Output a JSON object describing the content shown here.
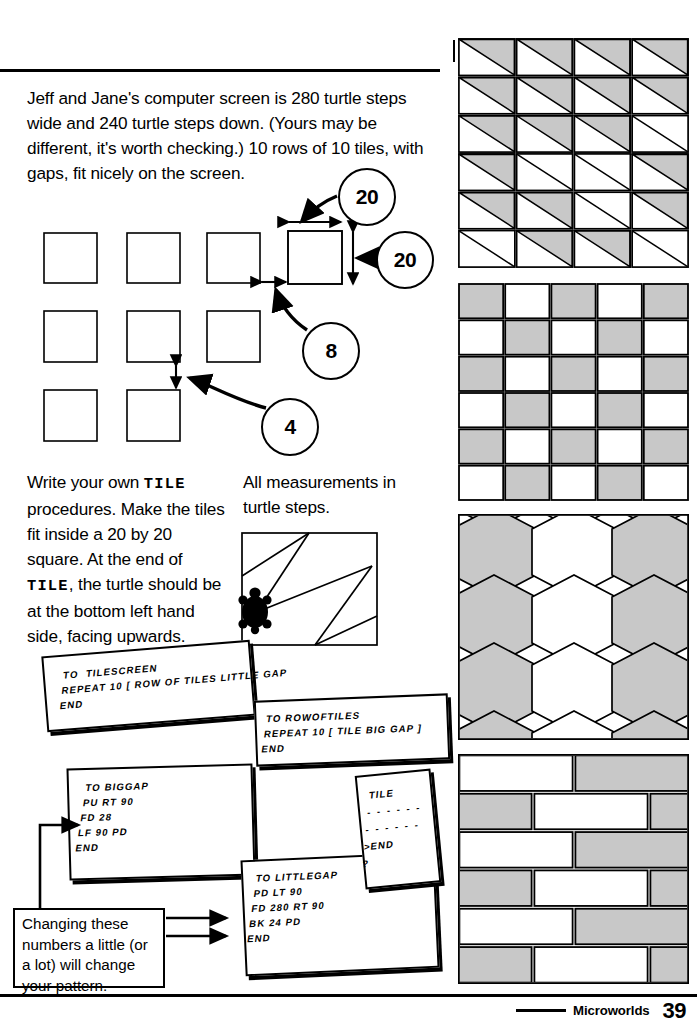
{
  "page": {
    "footer_label": "Microworlds",
    "page_number": "39",
    "ink_color": "#000000",
    "fill_gray": "#c8c8c8",
    "background": "#ffffff"
  },
  "intro": {
    "text": "Jeff and Jane's computer screen is 280 turtle steps wide and 240 turtle steps down. (Yours may be different, it's worth checking.) 10 rows of 10 tiles, with gaps, fit nicely on the screen."
  },
  "diagram": {
    "callouts": [
      {
        "id": "tile-width",
        "value": "20",
        "meaning": "tile width in turtle steps"
      },
      {
        "id": "tile-height",
        "value": "20",
        "meaning": "tile height in turtle steps"
      },
      {
        "id": "big-gap",
        "value": "8",
        "meaning": "horizontal gap between tiles"
      },
      {
        "id": "little-gap",
        "value": "4",
        "meaning": "vertical gap between rows"
      }
    ],
    "tile_rows": 3,
    "tile_cols": 3
  },
  "instructions": {
    "line1_a": "Write your own ",
    "tile_word_1": "TILE",
    "line1_b": " procedures. Make the tiles fit inside a 20 by 20 square. At the end of ",
    "tile_word_2": "TILE",
    "line1_c": ", the turtle should be at the bottom left hand side, facing upwards."
  },
  "measure_note": {
    "text": "All measurements in turtle steps."
  },
  "example_tile": {
    "caption": "example tile with turtle at bottom left",
    "turtle_icon": "turtle-icon"
  },
  "cards": [
    {
      "id": "tilescreen",
      "lines": [
        "TO  TILESCREEN",
        "REPEAT 10 [ ROW OF TILES LITTLE GAP",
        "END"
      ]
    },
    {
      "id": "rowoftiles",
      "lines": [
        "TO ROWOFTILES",
        "REPEAT 10 [ TILE BIG GAP ]",
        "END"
      ]
    },
    {
      "id": "biggap",
      "lines": [
        "TO BIGGAP",
        "PU RT 90",
        "FD 28",
        "LF 90 PD",
        "END"
      ]
    },
    {
      "id": "littlegap",
      "lines": [
        "TO LITTLEGAP",
        "PD LT 90",
        "FD 280 RT 90",
        "BK 24 PD",
        "END"
      ]
    },
    {
      "id": "tile",
      "lines": [
        "TILE",
        "- - - - - -",
        "- - - - - -",
        ">END",
        "?"
      ]
    }
  ],
  "caption": {
    "text": "Changing these numbers a little (or a lot) will change your pattern."
  },
  "patterns": [
    {
      "id": "triangles",
      "name": "triangle-tiling-pattern",
      "cols": 4,
      "rows": 6,
      "description": "Each square tile split by a diagonal; upper-left triangle shaded grey on most tiles."
    },
    {
      "id": "checkerboard",
      "name": "checkerboard-tiling-pattern",
      "cols": 5,
      "rows": 6,
      "description": "Alternating grey and white squares."
    },
    {
      "id": "hexagons",
      "name": "hexagon-tiling-pattern",
      "cols": 3,
      "rows": 4,
      "description": "Honeycomb of hexagons, shaded grey in alternating columns."
    },
    {
      "id": "bricks",
      "name": "brick-tiling-pattern",
      "cols": 2,
      "rows": 6,
      "description": "Offset running-bond bricks, alternating grey and white."
    }
  ]
}
